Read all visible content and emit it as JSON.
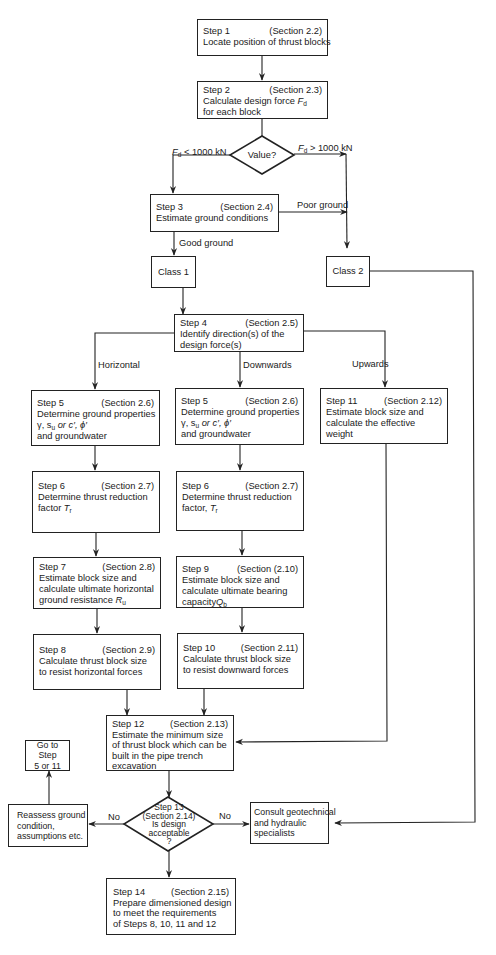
{
  "diagram": {
    "colors": {
      "line": "#222222",
      "background": "#ffffff",
      "text": "#1a1a1a"
    },
    "nodes": {
      "step1": {
        "step": "Step 1",
        "section": "(Section 2.2)",
        "lines": [
          "Locate position of thrust blocks"
        ]
      },
      "step2": {
        "step": "Step 2",
        "section": "(Section 2.3)",
        "lines": [
          "Calculate design force F_d",
          "for each block"
        ],
        "line1_prefix": "Calculate design force ",
        "line1_var": "F",
        "line1_sub": "d",
        "line2": "for each block"
      },
      "decision_value": {
        "text": "Value?"
      },
      "step3": {
        "step": "Step 3",
        "section": "(Section 2.4)",
        "lines": [
          "Estimate ground conditions"
        ]
      },
      "class1": {
        "text": "Class 1"
      },
      "class2": {
        "text": "Class 2"
      },
      "step4": {
        "step": "Step 4",
        "section": "(Section 2.5)",
        "lines": [
          "Identify direction(s) of the",
          "design force(s)"
        ]
      },
      "step5_h": {
        "step": "Step 5",
        "section": "(Section 2.6)",
        "lines": [
          "Determine ground properties",
          "γ, s_u or c′, ϕ′",
          "and groundwater"
        ],
        "line1": "Determine ground properties",
        "line3": "and groundwater"
      },
      "step5_d": {
        "step": "Step 5",
        "section": "(Section 2.6)",
        "lines": [
          "Determine ground properties",
          "γ, s_u or c′, ϕ′",
          "and groundwater"
        ],
        "line1": "Determine ground properties",
        "line3": "and groundwater"
      },
      "step11": {
        "step": "Step 11",
        "section": "(Section 2.12)",
        "lines": [
          "Estimate block size and",
          "calculate the effective",
          "weight"
        ]
      },
      "step6_h": {
        "step": "Step 6",
        "section": "(Section 2.7)",
        "lines": [
          "Determine thrust reduction",
          "factor T_r"
        ],
        "line1": "Determine thrust reduction",
        "line2_prefix": "factor "
      },
      "step6_d": {
        "step": "Step 6",
        "section": "(Section 2.7)",
        "lines": [
          "Determine thrust reduction",
          "factor, T_r"
        ],
        "line1": "Determine thrust reduction",
        "line2_prefix": "factor, "
      },
      "step7": {
        "step": "Step 7",
        "section": "(Section 2.8)",
        "lines": [
          "Estimate block size and",
          "calculate ultimate horizontal",
          "ground resistance R_u"
        ],
        "line3_prefix": "ground resistance "
      },
      "step9": {
        "step": "Step 9",
        "section": "(Section (2.10)",
        "lines": [
          "Estimate block size and",
          "calculate ultimate bearing",
          "capacity Q_b"
        ],
        "line3_prefix": "capacity"
      },
      "step8": {
        "step": "Step 8",
        "section": "(Section 2.9)",
        "lines": [
          "Calculate thrust block size",
          "to resist horizontal forces"
        ]
      },
      "step10": {
        "step": "Step 10",
        "section": "(Section 2.11)",
        "lines": [
          "Calculate thrust block size",
          "to resist downward forces"
        ]
      },
      "step12": {
        "step": "Step 12",
        "section": "(Section 2.13)",
        "lines": [
          "Estimate the minimum size",
          "of thrust block which can be",
          "built in the pipe trench",
          "excavation"
        ]
      },
      "goto": {
        "lines": [
          "Go to Step",
          "5 or 11"
        ]
      },
      "reassess": {
        "lines": [
          "Reassess ground",
          "condition,",
          "assumptions etc."
        ]
      },
      "step13": {
        "lines": [
          "Step 13",
          "(Section 2.14)",
          "Is design",
          "acceptable",
          "?"
        ]
      },
      "consult": {
        "lines": [
          "Consult geotechnical",
          "and hydraulic",
          "specialists"
        ]
      },
      "step14": {
        "step": "Step 14",
        "section": "(Section 2.15)",
        "lines": [
          "Prepare dimensioned design",
          "to meet the requirements",
          "of Steps 8, 10, 11 and 12"
        ]
      }
    },
    "edge_labels": {
      "fd_less": {
        "var": "F",
        "sub": "d",
        "rest": " < 1000 kN"
      },
      "fd_greater": {
        "var": "F",
        "sub": "d",
        "rest": " > 1000 kN"
      },
      "poor_ground": "Poor ground",
      "good_ground": "Good ground",
      "horizontal": "Horizontal",
      "downwards": "Downwards",
      "upwards": "Upwards",
      "no_left": "No",
      "no_right": "No"
    },
    "symbols": {
      "gamma_su": "γ, s",
      "su_sub": "u",
      "c_phi": " or c′, ϕ′",
      "T": "T",
      "r": "r",
      "R": "R",
      "u": "u",
      "Q": "Q",
      "b": "b"
    }
  }
}
